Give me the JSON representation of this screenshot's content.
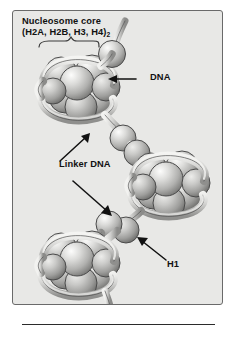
{
  "figure": {
    "domain_kind": "diagram",
    "panel": {
      "background_color": "#e8e8e6",
      "border_color": "#6a6a6a"
    },
    "page_background_color": "#ffffff",
    "caption_rule_color": "#2b2b2b"
  },
  "title": {
    "line1": "Nucleosome core",
    "line2_prefix": "(H2A, H2B, H3, H4)",
    "line2_subscript": "2"
  },
  "labels": {
    "dna": "DNA",
    "linker_dna": "Linker DNA",
    "h1": "H1"
  },
  "diagram_data": {
    "type": "schematic",
    "description": "Beads-on-a-string chromatin fiber: three nucleosome core particles, each an octamer of histone spheres wrapped by a DNA ribbon, joined by linker DNA passing through spherical H1 histones.",
    "nucleosomes": [
      {
        "id": "nucleosome-top",
        "center_x": 72,
        "center_y": 78,
        "histone_sphere_count": 8
      },
      {
        "id": "nucleosome-middle",
        "center_x": 152,
        "center_y": 172,
        "histone_sphere_count": 8
      },
      {
        "id": "nucleosome-bottom",
        "center_x": 70,
        "center_y": 253,
        "histone_sphere_count": 8
      }
    ],
    "h1_beads": [
      {
        "id": "h1-top",
        "cx": 110,
        "cy": 42,
        "r": 13
      },
      {
        "id": "h1-upper-middle",
        "cx": 119,
        "cy": 127,
        "r": 13
      },
      {
        "id": "h1-lower-middle",
        "cx": 131,
        "cy": 146,
        "r": 13
      },
      {
        "id": "h1-lower",
        "cx": 106,
        "cy": 215,
        "r": 13
      },
      {
        "id": "h1-bottom",
        "cx": 124,
        "cy": 229,
        "r": 13
      }
    ],
    "colors": {
      "histone_light": "#f0f0ee",
      "histone_mid": "#b8b8b6",
      "histone_dark": "#7d7d7b",
      "dna_ribbon_light": "#e2e2e0",
      "dna_ribbon_shadow": "#8d8d8b",
      "outline": "#4a4a4a",
      "label_text": "#111111"
    },
    "annotations": [
      {
        "label": "DNA",
        "arrow": "points left toward DNA ribbon leaving top nucleosome"
      },
      {
        "label": "Linker DNA",
        "arrow": "two arrows: up-right to upper linker, down-right to lower linker"
      },
      {
        "label": "H1",
        "arrow": "points up-left toward H1 bead"
      }
    ],
    "bracket": {
      "id": "core-bracket",
      "x_start": 36,
      "x_end": 92,
      "y": 40
    }
  }
}
